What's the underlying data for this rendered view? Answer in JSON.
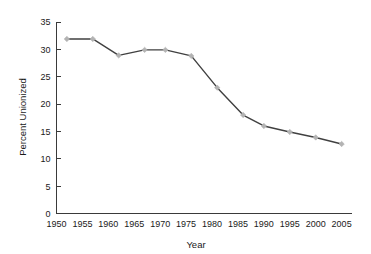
{
  "chart_data": {
    "type": "line",
    "title": "",
    "xlabel": "Year",
    "ylabel": "Percent Unionized",
    "xlim": [
      1950,
      2007
    ],
    "ylim": [
      0,
      35
    ],
    "grid": false,
    "legend": null,
    "x_ticks": [
      1950,
      1955,
      1960,
      1965,
      1970,
      1975,
      1980,
      1985,
      1990,
      1995,
      2000,
      2005
    ],
    "y_ticks": [
      0,
      5,
      10,
      15,
      20,
      25,
      30,
      35
    ],
    "series": [
      {
        "name": "Percent Unionized",
        "line_color": "#404040",
        "marker_color": "#b3b3b3",
        "marker": "diamond",
        "x": [
          1952,
          1957,
          1962,
          1967,
          1971,
          1976,
          1981,
          1986,
          1990,
          1995,
          2000,
          2005
        ],
        "values": [
          31.9,
          31.9,
          28.9,
          29.9,
          29.9,
          28.8,
          23.0,
          18.0,
          16.0,
          14.9,
          13.9,
          12.7
        ]
      }
    ]
  },
  "colors": {
    "background": "#ffffff",
    "axis": "#3a3a3a",
    "text": "#1a1a1a",
    "line": "#404040",
    "marker": "#b3b3b3"
  }
}
